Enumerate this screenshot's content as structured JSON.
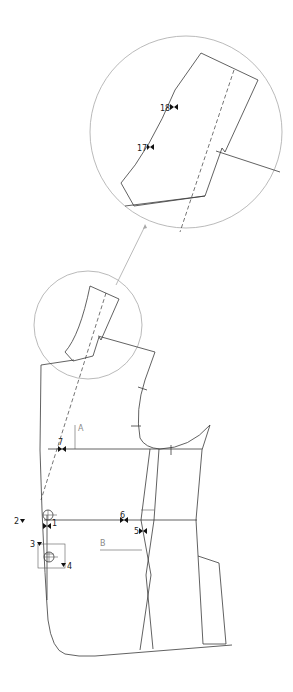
{
  "diagram": {
    "type": "sewing-pattern-draft",
    "colors": {
      "line": "#3a3a3a",
      "circle": "#a8a8a8",
      "label": "#222222",
      "guide_label": "#8a8a8a"
    }
  },
  "labels": {
    "detail": {
      "p18": "18",
      "p17": "17"
    },
    "main": {
      "A": "A",
      "B": "B",
      "p1": "1",
      "p2": "2",
      "p3": "3",
      "p4": "4",
      "p5": "5",
      "p6": "6",
      "p7": "7"
    }
  }
}
